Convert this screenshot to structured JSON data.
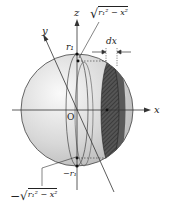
{
  "diagram": {
    "axes": {
      "x_label": "x",
      "y_label": "y",
      "z_label": "z",
      "origin_label": "O"
    },
    "labels": {
      "top_r": "r₁",
      "bottom_r": "−r₁",
      "top_sqrt": "√",
      "top_sqrt_expr": "r₁² − x²",
      "bottom_sqrt_prefix": "−√",
      "bottom_sqrt_expr": "r₁² − x²",
      "slab_width": "dx"
    },
    "colors": {
      "sphere_fill_light": "#f4f4f4",
      "sphere_fill_dark": "#bdbdbd",
      "slab_fill": "#4a4a4a",
      "slab_face": "#6a6a6a",
      "line": "#333333"
    }
  }
}
